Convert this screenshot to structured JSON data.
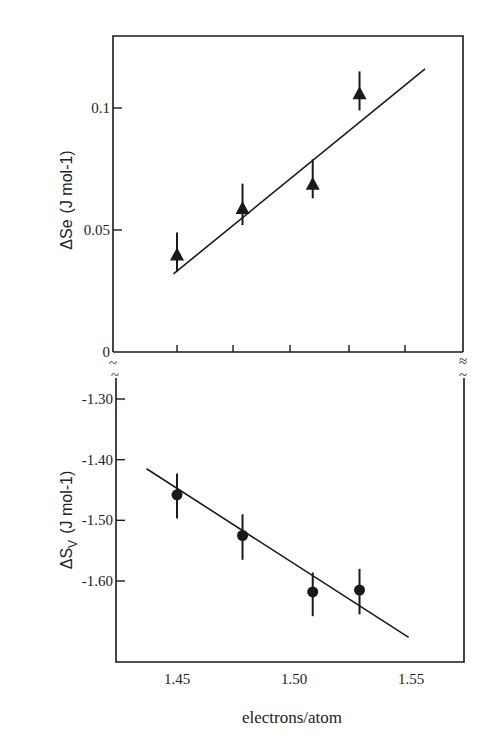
{
  "chart_data": [
    {
      "type": "scatter",
      "panel": "top",
      "title": "",
      "xlabel": "electrons/atom",
      "ylabel": "ΔSe (J mol-1)",
      "ylabel_main": "ΔSe",
      "ylabel_units": "(J mol-1)",
      "xlim": [
        1.42,
        1.57
      ],
      "ylim": [
        0,
        0.13
      ],
      "yticks": [
        0,
        0.05,
        0.1
      ],
      "ytick_labels": [
        "0",
        "0.05",
        "0.1"
      ],
      "xticks": [
        1.45,
        1.475,
        1.5,
        1.525,
        1.55
      ],
      "marker": "triangle",
      "series": [
        {
          "name": "ΔSe",
          "x": [
            1.45,
            1.478,
            1.508,
            1.528
          ],
          "y": [
            0.04,
            0.059,
            0.069,
            0.106
          ],
          "yerr_upper": [
            0.049,
            0.069,
            0.079,
            0.115
          ],
          "yerr_lower": [
            0.033,
            0.052,
            0.063,
            0.099
          ]
        }
      ],
      "fit_line": {
        "x": [
          1.4485,
          1.556
        ],
        "y": [
          0.032,
          0.116
        ]
      },
      "grid": false,
      "axis_break_marker": "≈"
    },
    {
      "type": "scatter",
      "panel": "bottom",
      "title": "",
      "xlabel": "electrons/atom",
      "ylabel": "ΔSv (J mol-1)",
      "ylabel_main": "ΔS",
      "ylabel_sub": "v",
      "ylabel_units": "(J mol-1)",
      "xlim": [
        1.42,
        1.57
      ],
      "ylim": [
        -1.75,
        -1.27
      ],
      "yticks": [
        -1.3,
        -1.4,
        -1.5,
        -1.6
      ],
      "ytick_labels": [
        "-1.30",
        "-1.40",
        "-1.50",
        "-1.60"
      ],
      "xticks": [
        1.45,
        1.5,
        1.55
      ],
      "xtick_labels": [
        "1.45",
        "1.50",
        "1.55"
      ],
      "marker": "circle",
      "series": [
        {
          "name": "ΔSv",
          "x": [
            1.45,
            1.478,
            1.508,
            1.528
          ],
          "y": [
            -1.458,
            -1.525,
            -1.618,
            -1.615
          ],
          "yerr_upper": [
            -1.423,
            -1.49,
            -1.586,
            -1.58
          ],
          "yerr_lower": [
            -1.497,
            -1.565,
            -1.658,
            -1.655
          ]
        }
      ],
      "fit_line": {
        "x": [
          1.437,
          1.549
        ],
        "y": [
          -1.415,
          -1.693
        ]
      },
      "grid": false
    }
  ],
  "labels": {
    "top_ylabel_main": "ΔSe",
    "top_ylabel_units": "(J mol-1)",
    "bottom_ylabel_main": "ΔS",
    "bottom_ylabel_sub": "V",
    "bottom_ylabel_units": "(J mol-1)",
    "xlabel": "electrons/atom",
    "break_marker": "~"
  },
  "colors": {
    "ink": "#1a1a1a",
    "background": "#ffffff"
  }
}
